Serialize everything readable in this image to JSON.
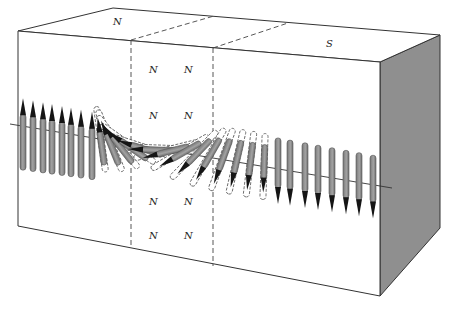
{
  "figure": {
    "type": "magnetic domain wall illustration",
    "colors": {
      "face_fill": "#ffffff",
      "side_face_fill": "#8e8e8e",
      "arrow_body": "#8a8a8a",
      "arrow_tip": "#1a1a1a",
      "edge": "#333333"
    }
  },
  "labels": {
    "top_left": "N",
    "top_right": "S",
    "wall_upper_row1": [
      "N",
      "N"
    ],
    "wall_upper_row2": [
      "N",
      "N"
    ],
    "wall_lower_row1": [
      "N",
      "N"
    ],
    "wall_lower_row2": [
      "N",
      "N"
    ]
  },
  "regions": [
    {
      "name": "left-domain",
      "spin_direction": "up"
    },
    {
      "name": "domain-wall",
      "spin_direction": "rotating"
    },
    {
      "name": "right-domain",
      "spin_direction": "down"
    }
  ]
}
